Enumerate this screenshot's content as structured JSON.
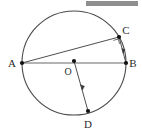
{
  "figure": {
    "top_strip": {
      "cut_text": "   ",
      "redaction_bar_color": "#8f8f8f"
    },
    "colors": {
      "stroke_dark": "#3a3a3a",
      "stroke_light": "#9a9a9a",
      "circle": "#4a4a4a",
      "point_fill": "#111111",
      "label": "#2b2b2b",
      "background": "#ffffff"
    },
    "circle": {
      "name": "circle-outline",
      "cx": 74,
      "cy": 63,
      "r": 52
    },
    "points": [
      {
        "id": "A",
        "label": "A",
        "x": 22,
        "y": 63,
        "label_x": 12,
        "label_y": 67
      },
      {
        "id": "B",
        "label": "B",
        "x": 126,
        "y": 63,
        "label_x": 131,
        "label_y": 67
      },
      {
        "id": "C",
        "label": "C",
        "x": 119,
        "y": 37,
        "label_x": 124,
        "label_y": 34
      },
      {
        "id": "D",
        "label": "D",
        "x": 88,
        "y": 111,
        "label_x": 84,
        "label_y": 127
      },
      {
        "id": "O",
        "label": "O",
        "x": 74,
        "y": 61,
        "label_x": 66,
        "label_y": 74
      }
    ],
    "segments": [
      {
        "id": "AB",
        "name": "segment-ab",
        "x1": 22,
        "y1": 63,
        "x2": 126,
        "y2": 63,
        "style": "light",
        "note": "diameter"
      },
      {
        "id": "AC",
        "name": "segment-ac",
        "x1": 22,
        "y1": 63,
        "x2": 119,
        "y2": 37,
        "style": "dark",
        "note": "chord"
      },
      {
        "id": "CB",
        "name": "segment-cb",
        "x1": 119,
        "y1": 37,
        "x2": 126,
        "y2": 63,
        "style": "dark",
        "note": "chord"
      },
      {
        "id": "OD",
        "name": "segment-od",
        "x1": 74,
        "y1": 61,
        "x2": 88,
        "y2": 111,
        "style": "dark",
        "note": "radius"
      }
    ],
    "marks": [
      {
        "id": "right-angle-C",
        "name": "right-angle-marker",
        "x": 114,
        "y": 41,
        "size": 5,
        "note": "right angle at C"
      },
      {
        "id": "tick-CB",
        "name": "congruence-tick-cb",
        "x": 123,
        "y": 50,
        "note": "tick on CB"
      },
      {
        "id": "tick-OD",
        "name": "congruence-tick-od",
        "x": 82,
        "y": 87,
        "note": "tick on OD"
      }
    ]
  }
}
